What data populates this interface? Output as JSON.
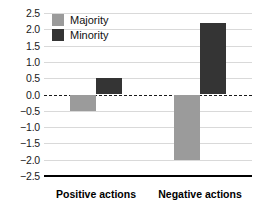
{
  "chart_data": {
    "type": "bar",
    "title": "",
    "subtitle": "",
    "xlabel": "",
    "ylabel": "",
    "categories": [
      "Positive actions",
      "Negative actions"
    ],
    "series": [
      {
        "name": "Majority",
        "color": "#9b9b9b",
        "values": [
          -0.5,
          -2.0
        ]
      },
      {
        "name": "Minority",
        "color": "#343434",
        "values": [
          0.5,
          2.2
        ]
      }
    ],
    "ylim": [
      -2.5,
      2.5
    ],
    "ytick_values": [
      2.5,
      2.0,
      1.5,
      1.0,
      0.5,
      0.0,
      -0.5,
      -1.0,
      -1.5,
      -2.0,
      -2.5
    ],
    "ytick_labels": [
      "2.5",
      "2.0",
      "1.5",
      "1.0",
      "0.5",
      "0.0",
      "−0.5",
      "−1.0",
      "−1.5",
      "−2.0",
      "−2.5"
    ],
    "grid": true,
    "grid_color": "#d9d9d9",
    "zero_line": {
      "value": 0.0,
      "style": "dashed",
      "color": "#1a1a1a"
    },
    "axis_line_color": "#000000",
    "legend": {
      "position": "top-left",
      "entries": [
        {
          "label": "Majority",
          "color": "#9b9b9b"
        },
        {
          "label": "Minority",
          "color": "#343434"
        }
      ]
    }
  }
}
